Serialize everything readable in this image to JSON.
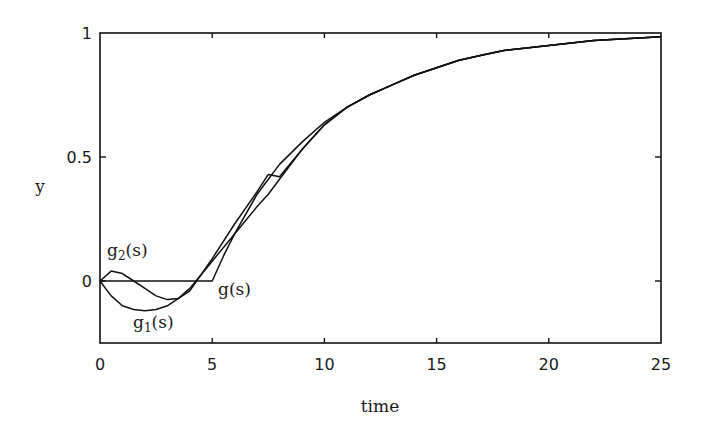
{
  "chart_data": {
    "type": "line",
    "title": "",
    "xlabel": "time",
    "ylabel": "y",
    "xlim": [
      0,
      25
    ],
    "ylim": [
      -0.25,
      1
    ],
    "xticks": [
      0,
      5,
      10,
      15,
      20,
      25
    ],
    "yticks": [
      0,
      0.5,
      1
    ],
    "xtick_labels": [
      "0",
      "5",
      "10",
      "15",
      "20",
      "25"
    ],
    "ytick_labels": [
      "0",
      "0.5",
      "1"
    ],
    "grid": false,
    "legend": "none (curves labeled inline)",
    "series": [
      {
        "name": "g(s)",
        "label_base": "g",
        "label_sub": "",
        "label_suffix": "(s)",
        "x": [
          0,
          5,
          5.5,
          6,
          7,
          8,
          9,
          10,
          11,
          12,
          13,
          14,
          15,
          16,
          17,
          18,
          19,
          20,
          21,
          22,
          23,
          24,
          25
        ],
        "y": [
          0,
          0,
          0.1,
          0.19,
          0.35,
          0.47,
          0.56,
          0.64,
          0.7,
          0.75,
          0.79,
          0.83,
          0.86,
          0.89,
          0.91,
          0.93,
          0.94,
          0.95,
          0.96,
          0.97,
          0.975,
          0.98,
          0.985
        ]
      },
      {
        "name": "g1(s)",
        "label_base": "g",
        "label_sub": "1",
        "label_suffix": "(s)",
        "x": [
          0,
          0.5,
          1,
          1.5,
          2,
          2.5,
          3,
          3.5,
          4,
          5,
          6,
          7,
          7.5,
          8,
          9,
          10,
          11,
          12,
          13,
          14,
          15,
          16,
          17,
          18,
          19,
          20,
          21,
          22,
          23,
          24,
          25
        ],
        "y": [
          0,
          -0.06,
          -0.1,
          -0.115,
          -0.12,
          -0.115,
          -0.1,
          -0.07,
          -0.03,
          0.08,
          0.19,
          0.3,
          0.35,
          0.41,
          0.53,
          0.63,
          0.7,
          0.75,
          0.79,
          0.83,
          0.86,
          0.89,
          0.91,
          0.93,
          0.94,
          0.95,
          0.96,
          0.97,
          0.975,
          0.98,
          0.985
        ]
      },
      {
        "name": "g2(s)",
        "label_base": "g",
        "label_sub": "2",
        "label_suffix": "(s)",
        "x": [
          0,
          0.5,
          1,
          1.5,
          2,
          2.5,
          3,
          3.5,
          4,
          5,
          6,
          7,
          7.5,
          8,
          9,
          10,
          11,
          12,
          13,
          14,
          15,
          16,
          17,
          18,
          19,
          20,
          21,
          22,
          23,
          24,
          25
        ],
        "y": [
          0,
          0.04,
          0.03,
          0.0,
          -0.03,
          -0.06,
          -0.075,
          -0.07,
          -0.04,
          0.09,
          0.23,
          0.36,
          0.43,
          0.42,
          0.53,
          0.63,
          0.7,
          0.75,
          0.79,
          0.83,
          0.86,
          0.89,
          0.91,
          0.93,
          0.94,
          0.95,
          0.96,
          0.97,
          0.975,
          0.98,
          0.985
        ]
      }
    ]
  },
  "layout": {
    "plot_left_px": 100,
    "plot_right_px": 661,
    "plot_top_px": 33,
    "plot_bottom_px": 343,
    "line_color": "#111111",
    "background": "#ffffff"
  },
  "labels": {
    "xlabel": "time",
    "ylabel": "y",
    "g_label": {
      "base": "g",
      "sub": "",
      "suffix": "(s)"
    },
    "g1_label": {
      "base": "g",
      "sub": "1",
      "suffix": "(s)"
    },
    "g2_label": {
      "base": "g",
      "sub": "2",
      "suffix": "(s)"
    }
  }
}
